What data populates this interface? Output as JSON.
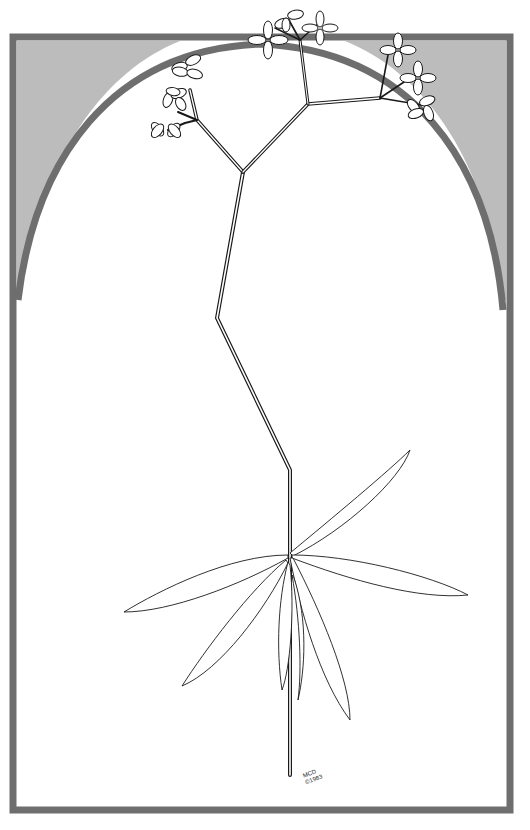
{
  "artwork": {
    "subject": "botanical line drawing of a flowering plant with whorled lance-shaped leaves inside a gray arched frame",
    "signature": {
      "initials": "MCD",
      "copyright": "©1983"
    },
    "colors": {
      "background": "#ffffff",
      "frame_border": "#6e6e6e",
      "spandrel_fill": "#bcbcbc",
      "line": "#1a1a1a"
    }
  }
}
